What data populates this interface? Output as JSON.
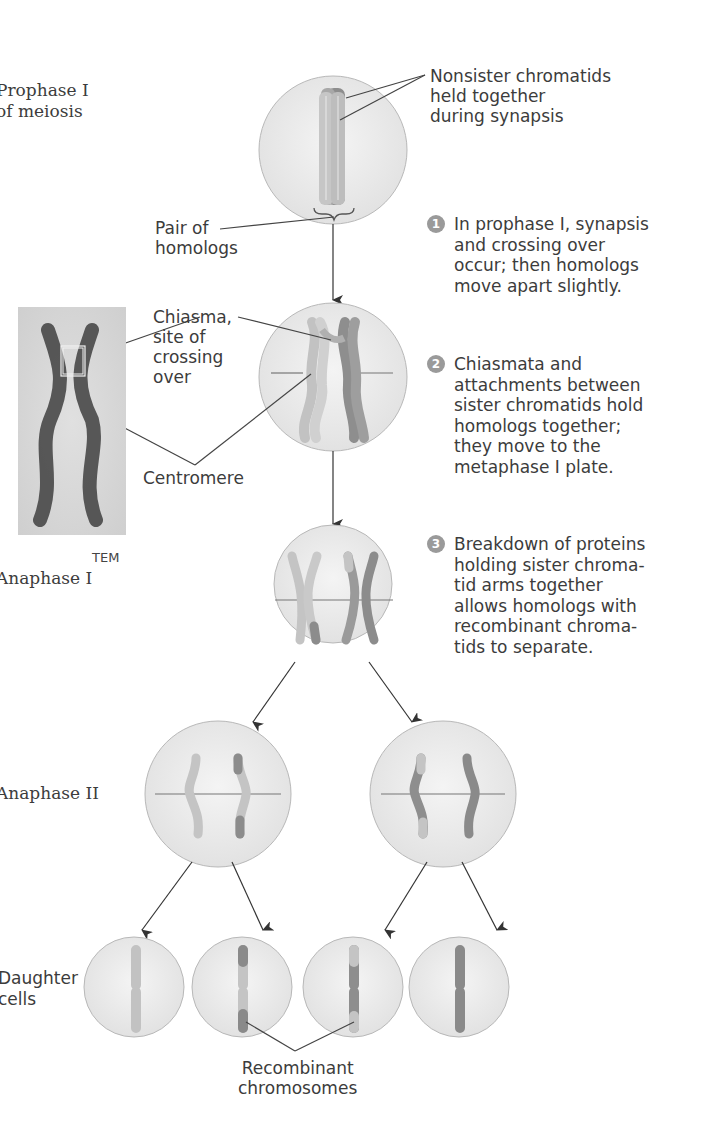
{
  "stages": {
    "prophase": "Prophase I\nof meiosis",
    "anaphase1": "Anaphase I",
    "anaphase2": "Anaphase II",
    "daughter": "Daughter\ncells"
  },
  "labels": {
    "nonsister": "Nonsister chromatids\nheld together\nduring synapsis",
    "pair_homologs": "Pair of\nhomologs",
    "chiasma": "Chiasma,\nsite of\ncrossing\nover",
    "centromere": "Centromere",
    "tem": "TEM",
    "recombinant": "Recombinant\nchromosomes"
  },
  "steps": [
    {
      "num": "1",
      "text": "In prophase I, synapsis\nand crossing over\noccur; then homologs\nmove apart slightly."
    },
    {
      "num": "2",
      "text": "Chiasmata and\nattachments between\nsister chromatids hold\nhomologs together;\nthey move to the\nmetaphase I plate."
    },
    {
      "num": "3",
      "text": "Breakdown of proteins\nholding sister chroma-\ntid arms together\nallows homologs with\nrecombinant chroma-\ntids to separate."
    }
  ],
  "colors": {
    "cell_fill": "#ebebeb",
    "cell_stroke": "#b5b5b5",
    "light_chromatid": "#c4c4c4",
    "dark_chromatid": "#8a8a8a",
    "step_badge": "#9a9a9a"
  }
}
